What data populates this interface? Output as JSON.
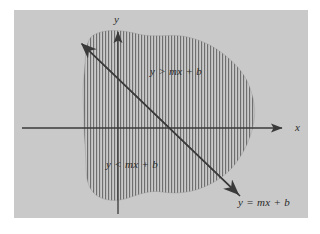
{
  "figure": {
    "kind": "cartesian-plane-linear-inequality-diagram",
    "background_color": "#ffffff",
    "plot_background_color": "#c9c9c9",
    "ink_color": "#3a3a3a",
    "hatch_color": "#6e6e6e",
    "plot_area": {
      "x": 14,
      "y": 10,
      "width": 294,
      "height": 208
    },
    "axes": {
      "x_axis": {
        "label": "x",
        "label_x": 295,
        "label_y": 122,
        "y": 128,
        "x_start": 22,
        "x_end": 288,
        "arrow": "right"
      },
      "y_axis": {
        "label": "y",
        "label_x": 114,
        "label_y": 14,
        "x": 118,
        "y_start": 214,
        "y_end": 26,
        "arrow": "up"
      },
      "origin": {
        "x": 118,
        "y": 128
      }
    },
    "boundary_line": {
      "label": "y = mx + b",
      "label_x": 238,
      "label_y": 197,
      "from": {
        "x": 80,
        "y": 42
      },
      "to": {
        "x": 240,
        "y": 196
      },
      "style": "solid",
      "arrow_both_ends": true,
      "slope_sign": "negative"
    },
    "regions": [
      {
        "name": "above-line",
        "label": "y > mx + b",
        "label_x": 150,
        "label_y": 66,
        "hatch": "vertical-lines"
      },
      {
        "name": "below-line",
        "label": "y < mx + b",
        "label_x": 106,
        "label_y": 159,
        "hatch": "vertical-lines"
      }
    ],
    "shaded_blob": {
      "description": "irregular wavy closed region filled with fine vertical hatching, straddling the boundary line",
      "hatch_spacing_px": 3,
      "hatch_line_width_px": 1
    }
  }
}
